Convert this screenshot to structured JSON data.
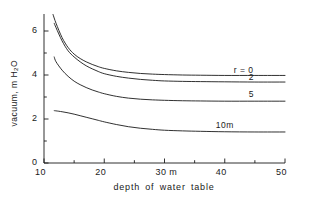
{
  "chart_data": {
    "type": "line",
    "title": "",
    "xlabel": "depth of water table",
    "ylabel": "vacuum, m H2O",
    "ylabel_parts": {
      "pre": "vacuum, m H",
      "sub": "2",
      "post": "O"
    },
    "xlim": [
      10,
      50
    ],
    "ylim": [
      0,
      6.8
    ],
    "grid": false,
    "legend_position": "inline-right-of-curves",
    "x_unit_annotation": "m",
    "x_ticks_major": [
      10,
      20,
      30,
      40,
      50
    ],
    "x_tick_labels": [
      "10",
      "20",
      "30 m",
      "40",
      "50"
    ],
    "y_ticks_major": [
      0,
      2,
      4,
      6
    ],
    "y_tick_labels": [
      "0",
      "2",
      "4",
      "6"
    ],
    "y_ticks_minor": [
      1,
      3,
      5
    ],
    "x_ticks_minor": [
      15,
      25,
      35,
      45
    ],
    "series": [
      {
        "name": "r = 0",
        "label": "r = 0",
        "color": "#1a1a1a",
        "label_x": 41.5,
        "label_y": 4.25,
        "x": [
          11.5,
          12,
          13,
          14,
          15,
          16,
          17,
          18,
          19,
          20,
          22,
          24,
          26,
          28,
          30,
          33,
          36,
          40,
          45,
          50
        ],
        "y": [
          6.75,
          6.35,
          5.7,
          5.25,
          4.95,
          4.75,
          4.6,
          4.48,
          4.38,
          4.3,
          4.19,
          4.12,
          4.07,
          4.04,
          4.02,
          4.0,
          3.99,
          3.98,
          3.98,
          3.98
        ]
      },
      {
        "name": "r = 2",
        "label": "2",
        "color": "#1a1a1a",
        "label_x": 44.0,
        "label_y": 3.92,
        "x": [
          11.7,
          12,
          13,
          14,
          15,
          16,
          17,
          18,
          19,
          20,
          22,
          24,
          26,
          28,
          30,
          33,
          36,
          40,
          45,
          50
        ],
        "y": [
          6.35,
          6.15,
          5.55,
          5.1,
          4.82,
          4.6,
          4.42,
          4.28,
          4.16,
          4.06,
          3.94,
          3.86,
          3.8,
          3.76,
          3.73,
          3.71,
          3.7,
          3.69,
          3.68,
          3.68
        ]
      },
      {
        "name": "r = 5",
        "label": "5",
        "color": "#1a1a1a",
        "label_x": 44.0,
        "label_y": 3.12,
        "x": [
          11.7,
          12,
          13,
          14,
          15,
          16,
          17,
          18,
          19,
          20,
          22,
          24,
          26,
          28,
          30,
          33,
          36,
          40,
          45,
          50
        ],
        "y": [
          4.82,
          4.6,
          4.22,
          3.94,
          3.72,
          3.56,
          3.43,
          3.32,
          3.23,
          3.15,
          3.03,
          2.95,
          2.9,
          2.87,
          2.85,
          2.83,
          2.82,
          2.81,
          2.81,
          2.81
        ]
      },
      {
        "name": "r = 10m",
        "label": "10m",
        "color": "#1a1a1a",
        "label_x": 38.5,
        "label_y": 1.72,
        "x": [
          11.7,
          12,
          13,
          14,
          15,
          16,
          17,
          18,
          19,
          20,
          22,
          24,
          26,
          28,
          30,
          33,
          36,
          40,
          45,
          50
        ],
        "y": [
          2.38,
          2.37,
          2.33,
          2.28,
          2.22,
          2.15,
          2.08,
          2.01,
          1.94,
          1.87,
          1.75,
          1.65,
          1.58,
          1.53,
          1.49,
          1.46,
          1.44,
          1.42,
          1.41,
          1.41
        ]
      }
    ]
  },
  "axes": {
    "x_title": "depth of water table",
    "y_title_pre": "vacuum, m H",
    "y_title_sub": "2",
    "y_title_post": "O"
  },
  "ticks": {
    "x": [
      {
        "value": 10,
        "label": "10"
      },
      {
        "value": 20,
        "label": "20"
      },
      {
        "value": 30,
        "label": "30 m"
      },
      {
        "value": 40,
        "label": "40"
      },
      {
        "value": 50,
        "label": "50"
      }
    ],
    "y": [
      {
        "value": 0,
        "label": "0"
      },
      {
        "value": 2,
        "label": "2"
      },
      {
        "value": 4,
        "label": "4"
      },
      {
        "value": 6,
        "label": "6"
      }
    ]
  },
  "style": {
    "line_color": "#1a1a1a",
    "axis_color": "#1a1a1a",
    "background": "#ffffff"
  }
}
